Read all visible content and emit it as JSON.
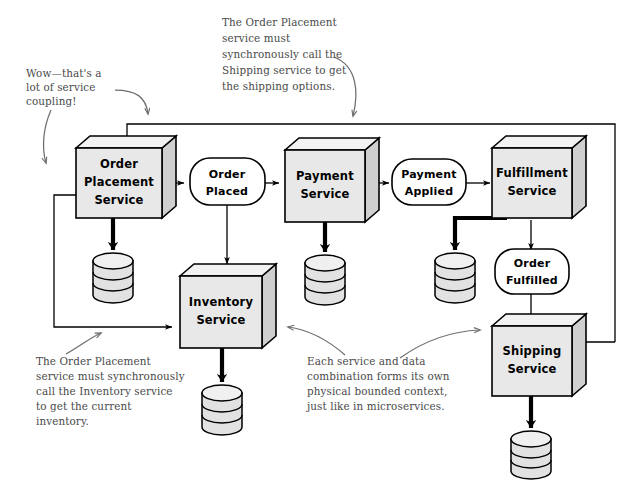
{
  "diagram": {
    "background_color": "#ffffff",
    "ink_color": "#000000",
    "note_color": "#4a4a4a",
    "box_fill": "#e8e8e8"
  },
  "services": [
    {
      "id": "order-placement-service",
      "line1": "Order",
      "line2": "Placement",
      "line3": "Service"
    },
    {
      "id": "payment-service",
      "line1": "Payment",
      "line2": "Service",
      "line3": ""
    },
    {
      "id": "fulfillment-service",
      "line1": "Fulfillment",
      "line2": "Service",
      "line3": ""
    },
    {
      "id": "inventory-service",
      "line1": "Inventory",
      "line2": "Service",
      "line3": ""
    },
    {
      "id": "shipping-service",
      "line1": "Shipping",
      "line2": "Service",
      "line3": ""
    }
  ],
  "events": [
    {
      "id": "order-placed",
      "line1": "Order",
      "line2": "Placed"
    },
    {
      "id": "payment-applied",
      "line1": "Payment",
      "line2": "Applied"
    },
    {
      "id": "order-fulfilled",
      "line1": "Order",
      "line2": "Fulfilled"
    }
  ],
  "databases": [
    {
      "id": "order-placement-database",
      "owner": "order-placement-service"
    },
    {
      "id": "payment-database",
      "owner": "payment-service"
    },
    {
      "id": "fulfillment-database",
      "owner": "fulfillment-service"
    },
    {
      "id": "inventory-database",
      "owner": "inventory-service"
    },
    {
      "id": "shipping-database",
      "owner": "shipping-service"
    }
  ],
  "annotations": {
    "coupling_note": {
      "id": "coupling-note",
      "lines": [
        "Wow—that's a",
        "lot of service",
        "coupling!"
      ]
    },
    "shipping_note": {
      "id": "shipping-sync-note",
      "lines": [
        "The Order Placement",
        "service must",
        "synchronously call the",
        "Shipping service to get",
        "the shipping options."
      ]
    },
    "inventory_note": {
      "id": "inventory-sync-note",
      "lines": [
        "The Order Placement",
        "service must synchronously",
        "call the Inventory service",
        "to get the current",
        "inventory."
      ]
    },
    "bounded_context_note": {
      "id": "bounded-context-note",
      "lines": [
        "Each service and data",
        "combination forms its own",
        "physical bounded context,",
        "just like in microservices."
      ]
    }
  }
}
